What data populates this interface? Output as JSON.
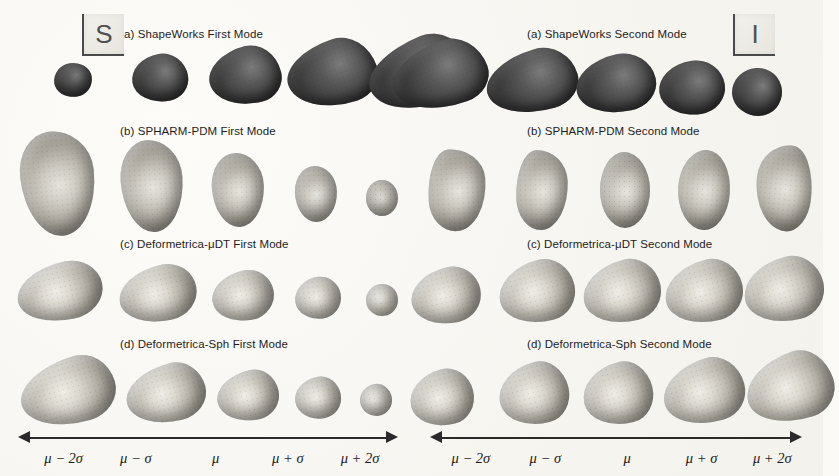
{
  "figure": {
    "background_color": "#f7f5f0",
    "orientation_markers": [
      {
        "id": "marker-superior",
        "label": "S",
        "x": 82,
        "y": 14
      },
      {
        "id": "marker-inferior",
        "label": "I",
        "x": 733,
        "y": 14
      }
    ]
  },
  "panels": [
    {
      "id": "left-panel",
      "mode": "First Mode",
      "rows": [
        {
          "key": "a",
          "label": "(a) ShapeWorks First Mode",
          "method": "ShapeWorks",
          "title_x": 120,
          "title_y": 28,
          "style": "b-dark",
          "shapes": [
            {
              "cx": 73,
              "cy": 80,
              "w": 38,
              "h": 34,
              "rot": -8,
              "r": "48% 52% 45% 55% / 52% 48% 52% 48%"
            },
            {
              "cx": 160,
              "cy": 78,
              "w": 56,
              "h": 48,
              "rot": -10,
              "r": "55% 45% 40% 60% / 50% 55% 45% 50%"
            },
            {
              "cx": 245,
              "cy": 76,
              "w": 72,
              "h": 58,
              "rot": -14,
              "r": "60% 40% 35% 65% / 48% 58% 42% 52%"
            },
            {
              "cx": 332,
              "cy": 74,
              "w": 90,
              "h": 66,
              "rot": -18,
              "r": "62% 38% 32% 68% / 45% 60% 40% 55%"
            },
            {
              "cx": 420,
              "cy": 74,
              "w": 104,
              "h": 70,
              "rot": -22,
              "r": "64% 36% 30% 70% / 44% 62% 38% 56%"
            }
          ]
        },
        {
          "key": "b",
          "label": "(b) SPHARM-PDM First Mode",
          "method": "SPHARM-PDM",
          "title_x": 120,
          "title_y": 125,
          "style": "b-mid",
          "shapes": [
            {
              "cx": 58,
              "cy": 183,
              "w": 74,
              "h": 105,
              "rot": -6,
              "r": "45% 55% 50% 50% / 40% 40% 60% 60%"
            },
            {
              "cx": 152,
              "cy": 186,
              "w": 62,
              "h": 92,
              "rot": -4,
              "r": "46% 54% 50% 50% / 42% 42% 58% 58%"
            },
            {
              "cx": 238,
              "cy": 190,
              "w": 52,
              "h": 74,
              "rot": -3,
              "r": "47% 53% 50% 50% / 44% 44% 56% 56%"
            },
            {
              "cx": 316,
              "cy": 194,
              "w": 42,
              "h": 56,
              "rot": -2,
              "r": "48% 52% 50% 50% / 46% 46% 54% 54%"
            },
            {
              "cx": 382,
              "cy": 198,
              "w": 32,
              "h": 36,
              "rot": 0,
              "r": "50% 50% 50% 50% / 50% 50% 50% 50%"
            }
          ]
        },
        {
          "key": "c",
          "label": "(c) Deformetrica-μDT First Mode",
          "method": "Deformetrica-μDT",
          "title_x": 120,
          "title_y": 238,
          "style": "b-light",
          "shapes": [
            {
              "cx": 60,
              "cy": 292,
              "w": 86,
              "h": 58,
              "rot": -12,
              "r": "62% 38% 40% 60% / 52% 50% 50% 48%"
            },
            {
              "cx": 158,
              "cy": 294,
              "w": 78,
              "h": 56,
              "rot": -12,
              "r": "62% 38% 40% 60% / 52% 50% 50% 48%"
            },
            {
              "cx": 243,
              "cy": 296,
              "w": 62,
              "h": 50,
              "rot": -10,
              "r": "60% 40% 42% 58% / 52% 50% 50% 48%"
            },
            {
              "cx": 318,
              "cy": 298,
              "w": 46,
              "h": 42,
              "rot": -8,
              "r": "56% 44% 45% 55% / 52% 50% 50% 48%"
            },
            {
              "cx": 382,
              "cy": 300,
              "w": 32,
              "h": 32,
              "rot": -6,
              "r": "52% 48% 48% 52% / 50% 50% 50% 50%"
            }
          ]
        },
        {
          "key": "d",
          "label": "(d) Deformetrica-Sph First Mode",
          "method": "Deformetrica-Sph",
          "title_x": 120,
          "title_y": 338,
          "style": "b-light",
          "shapes": [
            {
              "cx": 68,
              "cy": 392,
              "w": 96,
              "h": 66,
              "rot": -16,
              "r": "66% 34% 36% 64% / 50% 54% 46% 50%"
            },
            {
              "cx": 166,
              "cy": 394,
              "w": 80,
              "h": 58,
              "rot": -14,
              "r": "64% 36% 38% 62% / 50% 54% 46% 50%"
            },
            {
              "cx": 248,
              "cy": 396,
              "w": 62,
              "h": 50,
              "rot": -12,
              "r": "62% 38% 40% 60% / 50% 52% 48% 50%"
            },
            {
              "cx": 318,
              "cy": 398,
              "w": 46,
              "h": 42,
              "rot": -10,
              "r": "58% 42% 44% 56% / 50% 52% 48% 50%"
            },
            {
              "cx": 376,
              "cy": 400,
              "w": 32,
              "h": 32,
              "rot": -8,
              "r": "54% 46% 48% 52% / 50% 50% 50% 50%"
            }
          ]
        }
      ],
      "axis": {
        "x": 18,
        "y": 428,
        "width": 380,
        "labels": [
          {
            "text": "μ − 2σ",
            "pos": 12
          },
          {
            "text": "μ − σ",
            "pos": 31
          },
          {
            "text": "μ",
            "pos": 52
          },
          {
            "text": "μ + σ",
            "pos": 71
          },
          {
            "text": "μ + 2σ",
            "pos": 90
          }
        ]
      }
    },
    {
      "id": "right-panel",
      "mode": "Second Mode",
      "rows": [
        {
          "key": "a",
          "label": "(a) ShapeWorks Second Mode",
          "method": "ShapeWorks",
          "title_x": 115,
          "title_y": 28,
          "style": "b-dark",
          "shapes": [
            {
              "cx": 28,
              "cy": 76,
              "w": 96,
              "h": 66,
              "rot": -20,
              "r": "64% 36% 32% 68% / 46% 60% 40% 54%"
            },
            {
              "cx": 120,
              "cy": 82,
              "w": 92,
              "h": 62,
              "rot": -16,
              "r": "62% 38% 34% 66% / 48% 58% 42% 52%"
            },
            {
              "cx": 204,
              "cy": 84,
              "w": 80,
              "h": 58,
              "rot": -12,
              "r": "58% 42% 38% 62% / 50% 55% 45% 50%"
            },
            {
              "cx": 280,
              "cy": 88,
              "w": 66,
              "h": 54,
              "rot": -8,
              "r": "55% 45% 42% 58% / 50% 52% 48% 50%"
            },
            {
              "cx": 345,
              "cy": 92,
              "w": 50,
              "h": 48,
              "rot": -4,
              "r": "52% 48% 46% 54% / 50% 50% 50% 50%"
            }
          ]
        },
        {
          "key": "b",
          "label": "(b) SPHARM-PDM Second Mode",
          "method": "SPHARM-PDM",
          "title_x": 115,
          "title_y": 125,
          "style": "b-mid",
          "shapes": [
            {
              "cx": 45,
              "cy": 190,
              "w": 58,
              "h": 82,
              "rot": -4,
              "r": "40% 60% 55% 45% / 62% 38% 62% 38%"
            },
            {
              "cx": 130,
              "cy": 190,
              "w": 52,
              "h": 80,
              "rot": -2,
              "r": "42% 58% 54% 46% / 60% 40% 60% 40%"
            },
            {
              "cx": 213,
              "cy": 190,
              "w": 50,
              "h": 76,
              "rot": 0,
              "r": "48% 52% 50% 50% / 50% 50% 50% 50%"
            },
            {
              "cx": 292,
              "cy": 190,
              "w": 52,
              "h": 80,
              "rot": 4,
              "r": "52% 48% 46% 54% / 48% 52% 48% 52%"
            },
            {
              "cx": 372,
              "cy": 188,
              "w": 56,
              "h": 86,
              "rot": 6,
              "r": "58% 42% 40% 60% / 40% 60% 40% 60%"
            }
          ]
        },
        {
          "key": "c",
          "label": "(c) Deformetrica-μDT Second Mode",
          "method": "Deformetrica-μDT",
          "title_x": 115,
          "title_y": 238,
          "style": "b-light",
          "shapes": [
            {
              "cx": 34,
              "cy": 296,
              "w": 70,
              "h": 56,
              "rot": -12,
              "r": "60% 40% 40% 60% / 52% 50% 50% 48%"
            },
            {
              "cx": 125,
              "cy": 292,
              "w": 76,
              "h": 62,
              "rot": -14,
              "r": "62% 38% 38% 62% / 52% 52% 48% 48%"
            },
            {
              "cx": 210,
              "cy": 292,
              "w": 78,
              "h": 62,
              "rot": -14,
              "r": "62% 38% 38% 62% / 52% 52% 48% 48%"
            },
            {
              "cx": 292,
              "cy": 292,
              "w": 78,
              "h": 62,
              "rot": -14,
              "r": "62% 38% 38% 62% / 52% 52% 48% 48%"
            },
            {
              "cx": 372,
              "cy": 290,
              "w": 80,
              "h": 64,
              "rot": -14,
              "r": "62% 38% 38% 62% / 52% 52% 48% 48%"
            }
          ]
        },
        {
          "key": "d",
          "label": "(d) Deformetrica-Sph Second Mode",
          "method": "Deformetrica-Sph",
          "title_x": 115,
          "title_y": 338,
          "style": "b-light",
          "shapes": [
            {
              "cx": 30,
              "cy": 398,
              "w": 64,
              "h": 56,
              "rot": -14,
              "r": "60% 40% 40% 60% / 52% 50% 50% 48%"
            },
            {
              "cx": 122,
              "cy": 394,
              "w": 70,
              "h": 62,
              "rot": -14,
              "r": "62% 38% 38% 62% / 52% 52% 48% 48%"
            },
            {
              "cx": 206,
              "cy": 394,
              "w": 70,
              "h": 62,
              "rot": -14,
              "r": "62% 38% 38% 62% / 52% 52% 48% 48%"
            },
            {
              "cx": 292,
              "cy": 392,
              "w": 82,
              "h": 64,
              "rot": -16,
              "r": "64% 36% 36% 64% / 52% 54% 46% 48%"
            },
            {
              "cx": 378,
              "cy": 388,
              "w": 88,
              "h": 68,
              "rot": -18,
              "r": "66% 34% 34% 66% / 52% 56% 44% 48%"
            }
          ]
        }
      ],
      "axis": {
        "x": 18,
        "y": 428,
        "width": 372,
        "labels": [
          {
            "text": "μ − 2σ",
            "pos": 11
          },
          {
            "text": "μ − σ",
            "pos": 31
          },
          {
            "text": "μ",
            "pos": 53
          },
          {
            "text": "μ + σ",
            "pos": 73
          },
          {
            "text": "μ + 2σ",
            "pos": 92
          }
        ]
      }
    }
  ]
}
